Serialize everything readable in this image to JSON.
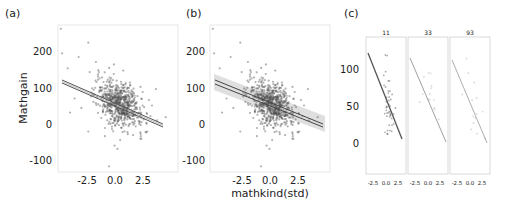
{
  "chart_data": [
    {
      "panel": "(a)",
      "type": "scatter",
      "xlabel": "",
      "ylabel": "Mathgain",
      "xlim": [
        -4.5,
        4.2
      ],
      "ylim": [
        -125,
        265
      ],
      "xticks": [
        -2.5,
        0.0,
        2.5
      ],
      "xtick_labels": [
        "-2.5",
        "0.0",
        "2.5"
      ],
      "yticks": [
        -100,
        0,
        100,
        200
      ],
      "ytick_labels": [
        "-100",
        "0",
        "100",
        "200"
      ],
      "fit_line": {
        "x": [
          -4.2,
          3.8
        ],
        "y": [
          117,
          -4
        ],
        "band": "narrow"
      },
      "points_note": "dense cloud centered near (0, 55), spread roughly x -2..2, y -10..130; outliers at (-4.3,255),(-2.3,218),(-4.2,190),(-3.0,180),(-0.8,-110),(-0.4,-55)"
    },
    {
      "panel": "(b)",
      "type": "scatter",
      "xlabel": "mathkind(std)",
      "ylabel": "",
      "xlim": [
        -4.5,
        4.2
      ],
      "ylim": [
        -125,
        265
      ],
      "xticks": [
        -2.5,
        0.0,
        2.5
      ],
      "xtick_labels": [
        "-2.5",
        "0.0",
        "2.5"
      ],
      "yticks": [
        -100,
        0,
        100,
        200
      ],
      "ytick_labels": [
        "-100",
        "0",
        "100",
        "200"
      ],
      "fit_lines": [
        {
          "x": [
            -4.2,
            3.8
          ],
          "y": [
            120,
            -2
          ]
        },
        {
          "x": [
            -4.2,
            3.8
          ],
          "y": [
            112,
            -6
          ]
        }
      ],
      "band": "wide shaded uncertainty band",
      "points_note": "same data as (a)"
    },
    {
      "panel": "(c)",
      "type": "scatter",
      "facets": [
        "11",
        "33",
        "93"
      ],
      "xlim": [
        -4.5,
        4.2
      ],
      "ylim": [
        -45,
        130
      ],
      "xticks": [
        -2.5,
        0.0,
        2.5
      ],
      "xtick_labels": [
        "-2.5",
        "0.0",
        "2.5"
      ],
      "yticks": [
        0,
        50,
        100
      ],
      "ytick_labels": [
        "0",
        "50",
        "100"
      ],
      "facet_lines": [
        {
          "facet": "11",
          "x": [
            -4.2,
            3.8
          ],
          "y": [
            122,
            8
          ]
        },
        {
          "facet": "33",
          "x": [
            -4.2,
            3.8
          ],
          "y": [
            115,
            2
          ]
        },
        {
          "facet": "93",
          "x": [
            -4.2,
            3.8
          ],
          "y": [
            113,
            0
          ]
        }
      ]
    }
  ],
  "panel_labels": {
    "a": "(a)",
    "b": "(b)",
    "c": "(c)"
  },
  "axis_labels": {
    "y_main": "Mathgain",
    "x_main": "mathkind(std)"
  },
  "ticks_ab": {
    "y": [
      "200",
      "100",
      "0",
      "-100"
    ],
    "x": [
      "-2.5",
      "0.0",
      "2.5"
    ]
  },
  "ticks_c": {
    "y": [
      "100",
      "50",
      "0"
    ],
    "x": [
      "-2.5",
      "0.0",
      "2.5"
    ]
  },
  "facet_titles": [
    "11",
    "33",
    "93"
  ],
  "colors": {
    "points": "#555555",
    "line": "#444444",
    "band": "#cccccc",
    "frame": "#dddddd"
  }
}
